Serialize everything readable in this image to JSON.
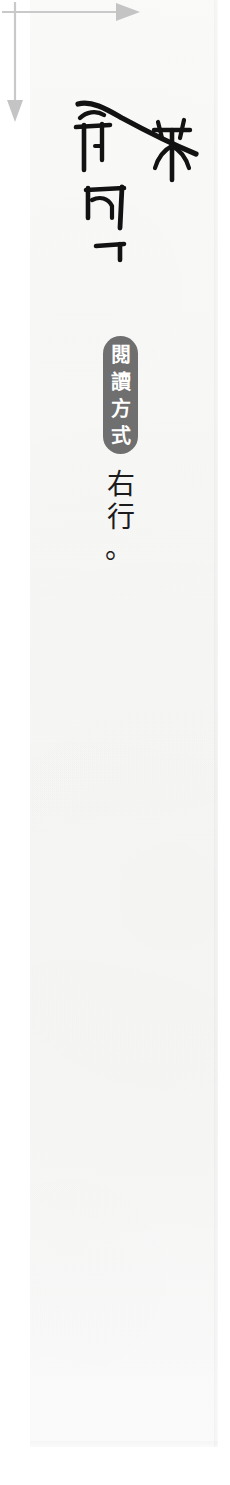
{
  "page": {
    "background_color": "#ffffff",
    "paper_color": "#f9f9f8"
  },
  "figure": {
    "name": "reading-direction-figure",
    "script_sample": {
      "label": "seal-script-rubbing",
      "glyphs": [
        "冊",
        "釆",
        "内",
        "十"
      ],
      "ink_color": "#111111",
      "description": "鐘鼎文摸本字例"
    },
    "arrows": [
      {
        "name": "column-direction-arrow",
        "orientation": "vertical",
        "direction": "down",
        "color": "#c8c8c8"
      },
      {
        "name": "line-order-arrow",
        "orientation": "horizontal",
        "direction": "right",
        "color": "#c8c8c8"
      }
    ]
  },
  "badge": {
    "name": "reading-method-badge",
    "text": "閱讀方式",
    "chars": [
      "閱",
      "讀",
      "方",
      "式"
    ],
    "background_color": "#6f6f6f",
    "text_color": "#ffffff"
  },
  "caption": {
    "name": "reading-direction-caption",
    "text": "右行。",
    "chars": [
      "右",
      "行"
    ],
    "period": "。",
    "text_color": "#1c1c1c"
  }
}
